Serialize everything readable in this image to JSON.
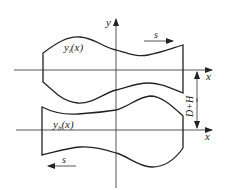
{
  "diagram": {
    "axes": {
      "y_label": "y",
      "upper_x_label": "x",
      "lower_x_label": "x"
    },
    "upper_profile": {
      "label_main": "y",
      "label_sub": "t",
      "label_arg": "(x)",
      "motion_label": "s",
      "motion_direction": "right"
    },
    "lower_profile": {
      "label_main": "y",
      "label_sub": "b",
      "label_arg": "(x)",
      "motion_label": "s",
      "motion_direction": "left"
    },
    "dimension": {
      "label": "D+H"
    }
  }
}
